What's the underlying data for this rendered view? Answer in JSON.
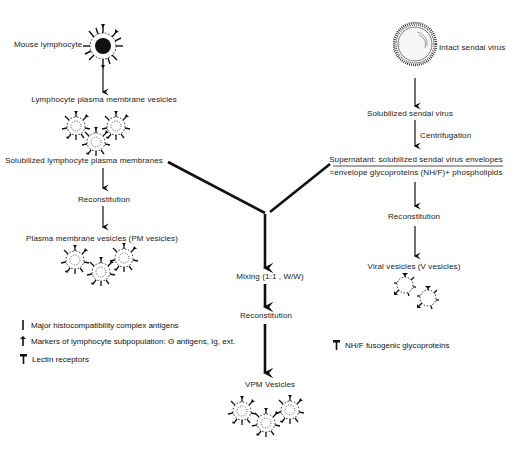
{
  "diagram": {
    "left_branch": {
      "mouse_lymphocyte": "Mouse lymphocyte",
      "pm_vesicles_step": "Lymphocyte plasma membrane vesicles",
      "solubilized": "Solubilized lymphocyte plasma membranes",
      "reconstitution": "Reconstitution",
      "pm_vesicles": "Plasma membrane vesicles (PM vesicles)"
    },
    "right_branch": {
      "intact_virus": "Intact sendai virus",
      "solubilized_virus": "Solubilized sendai virus",
      "centrifugation": "Centrifugation",
      "supernatant": "Supernatant: solubilized sendai virus envelopes",
      "envelope_composition": "=envelope glycoproteins (NH/F)+ phospholipids",
      "reconstitution": "Reconstitution",
      "viral_vesicles": "Viral vesicles (V vesicles)"
    },
    "center_branch": {
      "mixing": "Mixing (1:1 , W/W)",
      "reconstitution": "Reconstitution",
      "vpm_vesicles": "VPM Vesicles"
    },
    "legend_left": [
      {
        "icon": "major-histocompatibility-marker",
        "label": "Major histocompatibility complex antigens"
      },
      {
        "icon": "lymphocyte-subpopulation-marker",
        "label": "Markers of lymphocyte subpopulation: Θ antigens, Ig, ext."
      },
      {
        "icon": "lectin-receptor-marker",
        "label": "Lectin receptors"
      }
    ],
    "legend_right": [
      {
        "icon": "fusogenic-glycoprotein-marker",
        "label": "NH/F fusogenic glycoproteins"
      }
    ]
  }
}
